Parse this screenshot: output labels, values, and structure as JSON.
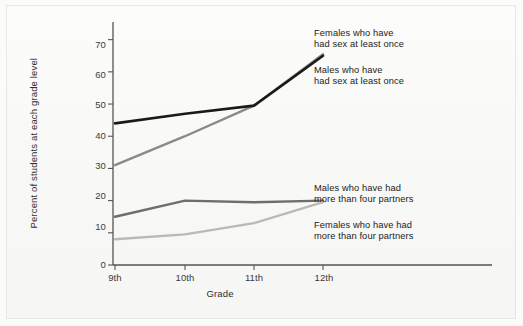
{
  "chart_data": {
    "type": "line",
    "title": "",
    "xlabel": "Grade",
    "ylabel": "Percent of students at each grade level",
    "categories": [
      "9th",
      "10th",
      "11th",
      "12th"
    ],
    "yticks": [
      0,
      10,
      20,
      30,
      40,
      50,
      60,
      70
    ],
    "ylim": [
      0,
      73
    ],
    "grid": false,
    "legend_position": "inline-annotations",
    "series": [
      {
        "name": "Females who have had sex at least once",
        "color": "#8a8a88",
        "values": [
          31,
          40,
          49.5,
          65.5
        ]
      },
      {
        "name": "Males who have had sex at least once",
        "color": "#1a1a18",
        "values": [
          44,
          47,
          49.5,
          65
        ]
      },
      {
        "name": "Males who have had more than four partners",
        "color": "#6e6e6c",
        "values": [
          15,
          20,
          19.5,
          20
        ]
      },
      {
        "name": "Females who have had more than four partners",
        "color": "#b9b9b7",
        "values": [
          8,
          9.5,
          13,
          19.5
        ]
      }
    ]
  },
  "annotations": {
    "females_sex_once": "Females who have\nhad sex at least once",
    "males_sex_once": "Males who have\nhad sex at least once",
    "males_four_partners": "Males who have had\nmore than four partners",
    "females_four_partners": "Females who have had\nmore than four partners"
  },
  "axis": {
    "x_title": "Grade",
    "y_title": "Percent of students at each grade level",
    "y_tick_labels": [
      "0",
      "10",
      "20",
      "30",
      "40",
      "50",
      "60",
      "70"
    ],
    "x_tick_labels": [
      "9th",
      "10th",
      "11th",
      "12th"
    ]
  },
  "colors": {
    "axis": "#55554f",
    "background": "#f9f9f8",
    "series_black": "#1a1a18",
    "series_mid_gray": "#8a8a88",
    "series_dark_gray": "#6e6e6c",
    "series_light_gray": "#b9b9b7"
  }
}
